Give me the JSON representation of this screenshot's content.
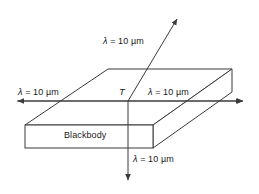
{
  "figure": {
    "type": "physics-diagram",
    "background_color": "#ffffff",
    "line_color": "#3a3a3a",
    "text_color": "#1a1a1a",
    "object": {
      "name": "Blackbody",
      "label": "Blackbody",
      "shape": "rectangular slab"
    },
    "temperature_symbol": "T",
    "emission_labels": {
      "top": "λ = 10 µm",
      "left": "λ = 10 µm",
      "right": "λ = 10 µm",
      "bottom": "λ = 10 µm"
    },
    "wavelength_value": "10",
    "wavelength_unit": "µm",
    "wavelength_symbol": "λ",
    "arrows": [
      {
        "name": "arrow-up-right",
        "direction": "up-right"
      },
      {
        "name": "arrow-left",
        "direction": "left"
      },
      {
        "name": "arrow-right",
        "direction": "right"
      },
      {
        "name": "arrow-down",
        "direction": "down"
      }
    ]
  }
}
